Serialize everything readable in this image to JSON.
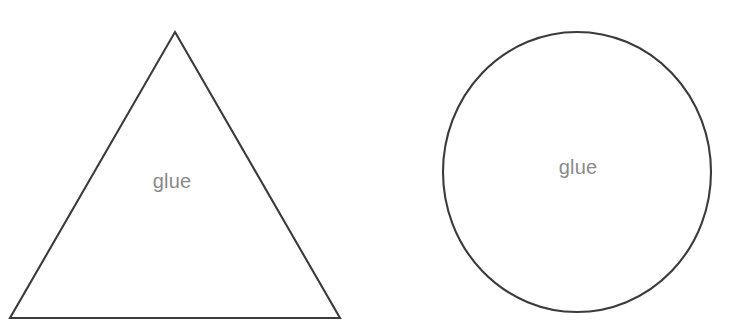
{
  "canvas": {
    "width": 747,
    "height": 336,
    "background_color": "#ffffff",
    "stroke_color": "#3b3b3b",
    "label_color": "#8a8a8a"
  },
  "shapes": [
    {
      "name": "triangle",
      "kind": "triangle",
      "label": "glue",
      "points": "175,32 340,318 10,318",
      "label_x": 172,
      "label_y": 183
    },
    {
      "name": "circle",
      "kind": "ellipse",
      "label": "glue",
      "cx": 577,
      "cy": 172,
      "rx": 134,
      "ry": 140,
      "label_x": 578,
      "label_y": 169
    }
  ]
}
